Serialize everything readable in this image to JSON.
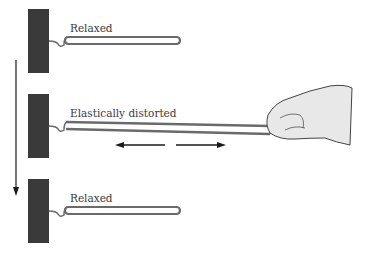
{
  "diagram": {
    "stages": [
      {
        "label": "Relaxed",
        "state": "relaxed"
      },
      {
        "label": "Elastically distorted",
        "state": "stretched"
      },
      {
        "label": "Relaxed",
        "state": "relaxed"
      }
    ],
    "icons": [
      "wall-block-icon",
      "hook-icon",
      "rubber-band-icon",
      "hand-icon",
      "arrow-left-icon",
      "arrow-right-icon",
      "arrow-down-icon"
    ],
    "colors": {
      "wall": "#3a3a3a",
      "band_outline": "#6a6a6a",
      "band_fill": "#ffffff",
      "arrow": "#1a1a1a",
      "text": "#3a3a3a",
      "hand": "#e8e8e8"
    }
  }
}
